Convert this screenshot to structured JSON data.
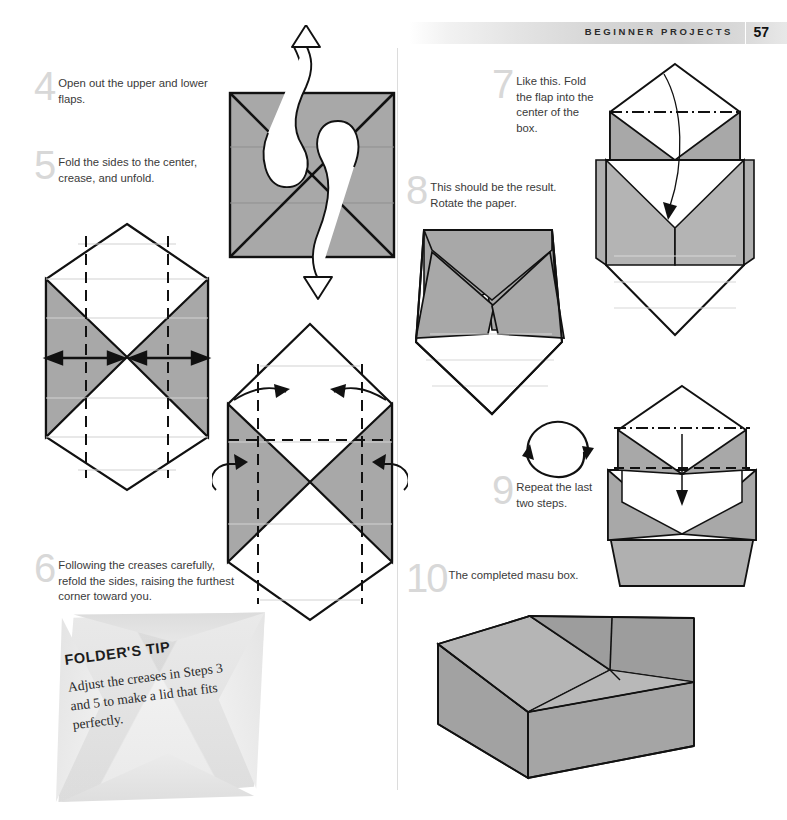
{
  "header": {
    "section_title": "BEGINNER PROJECTS",
    "page_number": "57"
  },
  "steps": [
    {
      "number": "4",
      "text": "Open out the upper and lower flaps."
    },
    {
      "number": "5",
      "text": "Fold the sides to the center, crease, and unfold."
    },
    {
      "number": "6",
      "text": "Following the creases carefully, refold the sides, raising the furthest corner toward you."
    },
    {
      "number": "7",
      "text": "Like this. Fold the flap into the center of the box."
    },
    {
      "number": "8",
      "text": "This should be the result. Rotate the paper."
    },
    {
      "number": "9",
      "text": "Repeat the last two steps."
    },
    {
      "number": "10",
      "text": "The completed masu box."
    }
  ],
  "tip": {
    "title": "FOLDER'S TIP",
    "body": "Adjust the creases in Steps 3 and 5 to make a lid that fits perfectly."
  },
  "diagrams": [
    {
      "id": "step4-diagram",
      "caption": "square with diagonal creases and two curved open-out arrows"
    },
    {
      "id": "step5-diagram",
      "caption": "hexagonal sheet with gray side flaps, dashed vertical creases and double-headed arrows"
    },
    {
      "id": "step6-diagram",
      "caption": "hexagonal sheet with dashed creases and curved fold arrows"
    },
    {
      "id": "step7-diagram",
      "caption": "partly formed box with dash-dot crease and curved arrow into the center"
    },
    {
      "id": "step8-diagram",
      "caption": "resulting box shape seen from the front"
    },
    {
      "id": "rotate-symbol",
      "caption": "circular rotate-the-paper arrows"
    },
    {
      "id": "step9-diagram",
      "caption": "box with straight arrow folding the flap in"
    },
    {
      "id": "step10-diagram",
      "caption": "completed masu box in three-quarter view"
    }
  ],
  "colors": {
    "paper_gray": "#a8a8a8",
    "paper_gray_light": "#c9c9c9",
    "outline": "#111111",
    "crease_light": "#d8d8d8",
    "step_number": "#d8d8d8",
    "text": "#3a3a3a",
    "header_band": "#d6d6d6"
  }
}
